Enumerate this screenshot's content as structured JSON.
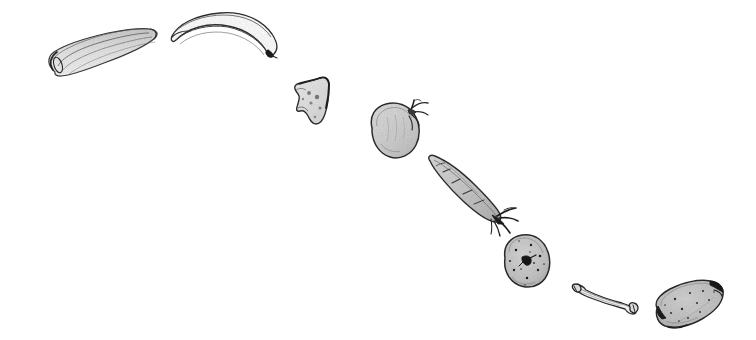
{
  "artwork": {
    "title": "Hand-drawn pencil sketch of assorted foods arranged along a descending arc",
    "medium": "graphite pencil line drawing with grey wash shading",
    "background_color": "#ffffff",
    "ink_color": "#2b2b2b",
    "wash_light": "#e8e8e8",
    "wash_mid": "#d2d2d2",
    "wash_dark": "#b4b4b4",
    "canvas": {
      "width": 756,
      "height": 340
    },
    "composition": "eight isolated food objects drawn in a loose arc that begins at the upper-left and descends to the lower-right"
  },
  "objects": [
    {
      "id": "celery-stalk",
      "label": "Celery stalk",
      "description": "Long ribbed stalk with rounded base, drawn with multiple parallel ribs and light grey wash",
      "bbox": {
        "x": 38,
        "y": 28,
        "width": 122,
        "height": 50
      },
      "order": 1
    },
    {
      "id": "banana",
      "label": "Banana",
      "description": "Curved crescent with pointed dark tip at lower right, outline only with white interior",
      "bbox": {
        "x": 168,
        "y": 12,
        "width": 112,
        "height": 50
      },
      "order": 2
    },
    {
      "id": "cheese-wedge",
      "label": "Cheese wedge",
      "description": "Irregular triangular wedge with small round holes and pale grey fill",
      "bbox": {
        "x": 292,
        "y": 74,
        "width": 42,
        "height": 52
      },
      "order": 3
    },
    {
      "id": "tomato",
      "label": "Tomato",
      "description": "Rounded fruit with grey wash body and a spiky calyx stem at the upper right",
      "bbox": {
        "x": 366,
        "y": 102,
        "width": 62,
        "height": 58
      },
      "order": 4
    },
    {
      "id": "carrot",
      "label": "Carrot",
      "description": "Tapered root angled down-right with dark leafy sprigs at the narrow tip",
      "bbox": {
        "x": 424,
        "y": 155,
        "width": 90,
        "height": 68
      },
      "order": 5
    },
    {
      "id": "potato",
      "label": "Potato",
      "description": "Rounded tuber with speckled eyes and one dark sprouting eye at the centre",
      "bbox": {
        "x": 498,
        "y": 234,
        "width": 52,
        "height": 54
      },
      "order": 6
    },
    {
      "id": "bone",
      "label": "Bone",
      "description": "Slender bone with flared knobby ends, drawn in thin outline",
      "bbox": {
        "x": 570,
        "y": 284,
        "width": 72,
        "height": 30
      },
      "order": 7
    },
    {
      "id": "melon",
      "label": "Speckled oval melon",
      "description": "Pointed oval with dark tips and a speckled grey interior",
      "bbox": {
        "x": 652,
        "y": 280,
        "width": 78,
        "height": 52
      },
      "order": 8
    }
  ]
}
